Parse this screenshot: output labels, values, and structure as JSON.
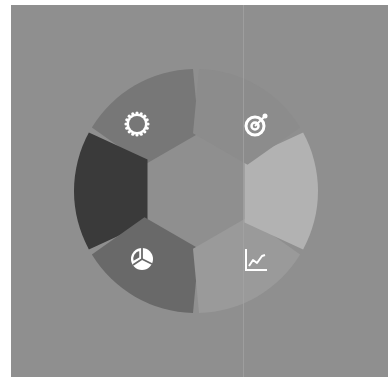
{
  "diagram": {
    "type": "hexagonal-cycle-ring",
    "center": [
      196,
      191
    ],
    "outer_radius": 122,
    "inner_hex_apothem": 50,
    "background_color": "#8f8f8f",
    "segments": [
      {
        "id": "top-left",
        "start_deg": 90,
        "end_deg": 150,
        "color": "#777777",
        "icon": "gear-icon"
      },
      {
        "id": "left",
        "start_deg": 150,
        "end_deg": 210,
        "color": "#3a3a3a",
        "icon": ""
      },
      {
        "id": "bottom-left",
        "start_deg": 210,
        "end_deg": 270,
        "color": "#696969",
        "icon": "pie-chart-icon"
      },
      {
        "id": "bottom-right",
        "start_deg": 270,
        "end_deg": 330,
        "color": "#9a9a9a",
        "icon": "line-chart-icon"
      },
      {
        "id": "right",
        "start_deg": 330,
        "end_deg": 390,
        "color": "#b2b2b2",
        "icon": ""
      },
      {
        "id": "top-right",
        "start_deg": 30,
        "end_deg": 90,
        "color": "#8c8c8c",
        "icon": "target-icon"
      }
    ],
    "icon_color": "#ffffff"
  }
}
